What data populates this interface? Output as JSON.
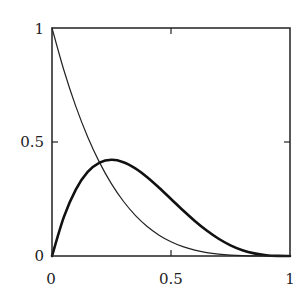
{
  "chart_data": {
    "type": "line",
    "title": "",
    "xlabel": "",
    "ylabel": "",
    "xlim": [
      0,
      1
    ],
    "ylim": [
      0,
      1
    ],
    "grid": false,
    "legend": null,
    "x_ticks": [
      {
        "value": 0,
        "label": "0"
      },
      {
        "value": 0.5,
        "label": "0.5"
      },
      {
        "value": 1,
        "label": "1"
      }
    ],
    "y_ticks": [
      {
        "value": 0,
        "label": "0"
      },
      {
        "value": 0.5,
        "label": "0.5"
      },
      {
        "value": 1,
        "label": "1"
      }
    ],
    "series": [
      {
        "name": "thin curve (1-x)^4",
        "style": "thin",
        "color": "#222222",
        "x": [
          0,
          0.05,
          0.1,
          0.15,
          0.2,
          0.25,
          0.3,
          0.35,
          0.4,
          0.45,
          0.5,
          0.55,
          0.6,
          0.65,
          0.7,
          0.75,
          0.8,
          0.85,
          0.9,
          0.95,
          1.0
        ],
        "y": [
          1.0,
          0.8145,
          0.6561,
          0.522,
          0.4096,
          0.3164,
          0.2401,
          0.1785,
          0.1296,
          0.0915,
          0.0625,
          0.041,
          0.0256,
          0.015,
          0.0081,
          0.0039,
          0.0016,
          0.0005,
          0.0001,
          0.0,
          0.0
        ]
      },
      {
        "name": "thick curve 4x(1-x)^3",
        "style": "thick",
        "color": "#111111",
        "x": [
          0,
          0.05,
          0.1,
          0.15,
          0.2,
          0.25,
          0.3,
          0.35,
          0.4,
          0.45,
          0.5,
          0.55,
          0.6,
          0.65,
          0.7,
          0.75,
          0.8,
          0.85,
          0.9,
          0.95,
          1.0
        ],
        "y": [
          0.0,
          0.1715,
          0.2916,
          0.3685,
          0.4096,
          0.4219,
          0.4116,
          0.3845,
          0.3456,
          0.2995,
          0.25,
          0.2005,
          0.1536,
          0.1115,
          0.0756,
          0.0469,
          0.0256,
          0.0115,
          0.0036,
          0.0005,
          0.0
        ]
      }
    ]
  },
  "labels": {
    "x0": "0",
    "x05": "0.5",
    "x1": "1",
    "y0": "0",
    "y05": "0.5",
    "y1": "1"
  }
}
